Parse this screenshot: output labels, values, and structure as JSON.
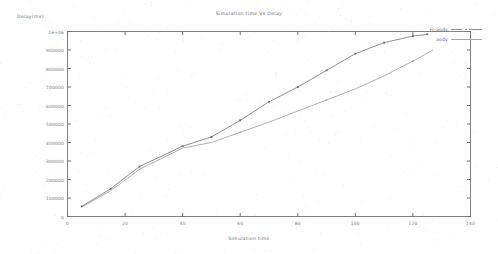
{
  "chart_data": {
    "type": "line",
    "title": "Simulation time Vs Delay",
    "xlabel": "Simulation time",
    "ylabel": "Delay(ms)",
    "xlim": [
      0,
      140
    ],
    "ylim": [
      0,
      1000000
    ],
    "grid": false,
    "legend_position": "top-right",
    "xticks": [
      "0",
      "20",
      "40",
      "60",
      "80",
      "100",
      "120",
      "140"
    ],
    "xtick_values": [
      0,
      20,
      40,
      60,
      80,
      100,
      120,
      140
    ],
    "yticks": [
      "0",
      "100000",
      "200000",
      "300000",
      "400000",
      "500000",
      "600000",
      "700000",
      "800000",
      "900000",
      "1e+06"
    ],
    "ytick_values": [
      0,
      100000,
      200000,
      300000,
      400000,
      500000,
      600000,
      700000,
      800000,
      900000,
      1000000
    ],
    "series": [
      {
        "name": "Fr-aodv",
        "color": "#7a7a7a",
        "marker": "point",
        "x": [
          5,
          15,
          25,
          40,
          50,
          60,
          70,
          80,
          90,
          100,
          110,
          120,
          125
        ],
        "y": [
          55000,
          150000,
          270000,
          380000,
          430000,
          520000,
          620000,
          700000,
          790000,
          880000,
          940000,
          975000,
          985000
        ]
      },
      {
        "name": "aodv",
        "color": "#a0a0a0",
        "marker": "point",
        "x": [
          5,
          15,
          25,
          40,
          50,
          60,
          70,
          80,
          90,
          100,
          110,
          120,
          127
        ],
        "y": [
          50000,
          140000,
          255000,
          370000,
          400000,
          455000,
          510000,
          570000,
          630000,
          690000,
          760000,
          840000,
          900000
        ]
      }
    ]
  },
  "legend": {
    "entries": [
      {
        "label": "Fr-aodv"
      },
      {
        "label": "aodv"
      }
    ]
  }
}
